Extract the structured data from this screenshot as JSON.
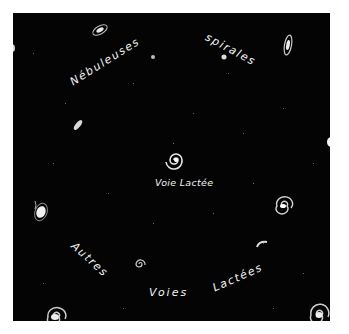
{
  "figure": {
    "background_color": "#040404",
    "text_color": "#f2f2f2",
    "labels": {
      "top_left": "Nébuleuses",
      "top_right": "spirales",
      "center": "Voie Lactée",
      "bottom_left": "Autres",
      "bottom_middle": "Voies",
      "bottom_right": "Lactées"
    },
    "caption_full": {
      "top": "Nébuleuses spirales",
      "bottom": "Autres Voies Lactées"
    }
  }
}
